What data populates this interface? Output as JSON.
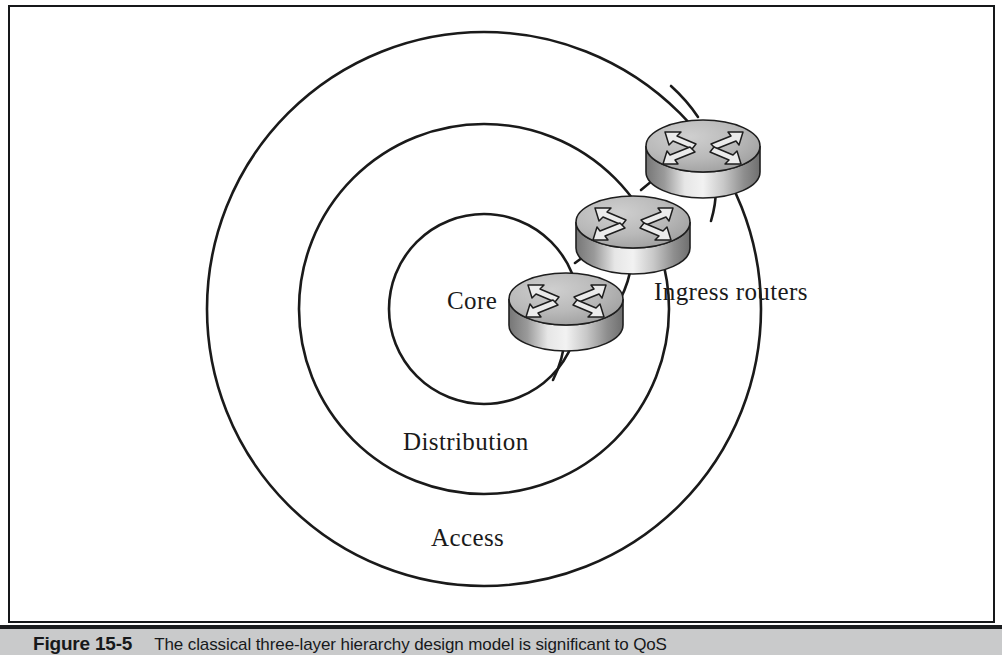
{
  "figure": {
    "caption_label": "Figure 15-5",
    "caption_text": "The classical three-layer hierarchy design model is significant to QoS"
  },
  "diagram": {
    "type": "concentric-ring-hierarchy",
    "rings": [
      {
        "id": "core",
        "label": "Core",
        "order": 1,
        "role": "innermost layer"
      },
      {
        "id": "distribution",
        "label": "Distribution",
        "order": 2,
        "role": "middle layer"
      },
      {
        "id": "access",
        "label": "Access",
        "order": 3,
        "role": "outermost layer"
      }
    ],
    "annotations": [
      {
        "id": "ingress-routers",
        "label": "Ingress routers"
      }
    ],
    "nodes": [
      {
        "id": "router-1",
        "type": "router",
        "layer": "core"
      },
      {
        "id": "router-2",
        "type": "router",
        "layer": "distribution"
      },
      {
        "id": "router-3",
        "type": "router",
        "layer": "access"
      }
    ],
    "colors": {
      "stroke": "#1a1a1a",
      "background": "#ffffff",
      "router_top": "#b4b4b4",
      "router_side": "#8c8c8c",
      "caption_band": "#c9cacb"
    }
  }
}
